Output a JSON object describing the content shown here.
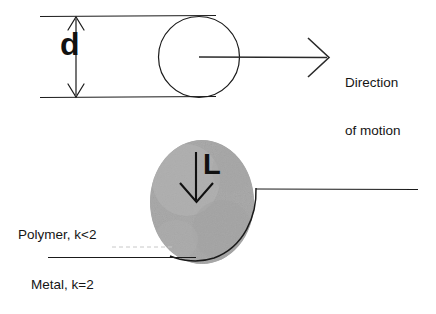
{
  "figure": {
    "background_color": "#ffffff",
    "stroke_color": "#1a1a1a",
    "blob_fill_color": "#ababab",
    "dashed_line_color": "#c8c8c8"
  },
  "top_diagram": {
    "diameter_label": "d",
    "direction_label_line1": "Direction",
    "direction_label_line2": "of motion",
    "circle": {
      "center_x": 199,
      "center_y": 57,
      "radius": 40.5
    },
    "channel": {
      "top_line_y": 16,
      "bottom_line_y": 97,
      "left_x": 40,
      "right_x": 216
    },
    "dimension_arrow": {
      "x": 76,
      "top_y": 16,
      "bottom_y": 97,
      "style": "double-headed"
    },
    "motion_arrow": {
      "start_x": 199,
      "end_x": 327,
      "y": 57,
      "style": "open-chevron"
    }
  },
  "bottom_diagram": {
    "load_label": "L",
    "polymer_label": "Polymer, k<2",
    "metal_label": "Metal, k=2",
    "blob": {
      "center_x": 202,
      "center_y": 202,
      "radius_x": 52,
      "radius_y": 62
    },
    "load_arrow": {
      "x": 196,
      "start_y": 152,
      "end_y": 202,
      "style": "open-chevron-down"
    },
    "polymer_surface_line": {
      "y": 189,
      "start_x": 256,
      "end_x": 418,
      "style": "solid"
    },
    "polymer_dashed_line": {
      "y": 247,
      "start_x": 112,
      "end_x": 172,
      "style": "dashed"
    },
    "metal_surface_line": {
      "y": 257,
      "start_x": 48,
      "end_x": 196,
      "style": "solid"
    }
  }
}
